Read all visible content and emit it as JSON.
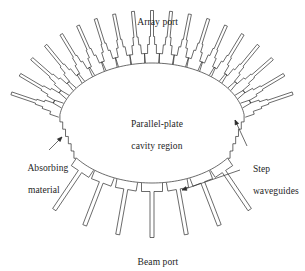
{
  "figure": {
    "type": "technical-line-diagram",
    "width": 305,
    "height": 265,
    "background_color": "#ffffff",
    "line_color": "#2b2b2b",
    "line_width": 0.7,
    "text_color": "#1d1d1d"
  },
  "labels": {
    "array_port": "Array port",
    "cavity_line1": "Parallel-plate",
    "cavity_line2": "cavity region",
    "absorbing_line1": "Absorbing",
    "absorbing_line2": "material",
    "step_line1": "Step",
    "step_line2": "waveguides",
    "beam_port": "Beam port"
  },
  "label_positions": {
    "array_port": {
      "x": 111,
      "y": 6,
      "w": 84
    },
    "cavity": {
      "x": 100,
      "y": 108,
      "w": 104
    },
    "absorbing": {
      "x": 18,
      "y": 152,
      "w": 66
    },
    "step": {
      "x": 243,
      "y": 153,
      "w": 62
    },
    "beam_port": {
      "x": 113,
      "y": 246,
      "w": 80
    }
  },
  "geometry": {
    "cavity_center": {
      "cx": 152,
      "cy": 123
    },
    "cavity_radius": {
      "rx": 93,
      "ry": 60
    },
    "array_arc_deg": {
      "start": 188,
      "end": 352
    },
    "beam_arc_deg": {
      "start": 36,
      "end": 144
    },
    "array_waveguide_count": 19,
    "beam_waveguide_count": 7,
    "staircase_steps": 6
  },
  "waveguide_profile": {
    "base_half_width": 7.4,
    "base_length": 9.5,
    "mid_half_width": 4.4,
    "mid_length": 9.0,
    "step_half_width": 2.6,
    "step_length": 8.0,
    "stem_half_width": 1.5,
    "stem_length": 26
  },
  "beam_waveguide_profile": {
    "base_half_width": 10.5,
    "base_length": 8.5,
    "stem_half_width": 2.0,
    "stem_length": 46
  },
  "leaders": {
    "absorbing": {
      "x1": 49,
      "y1": 150,
      "x2": 62,
      "y2": 137
    },
    "step_upper": {
      "x1": 247,
      "y1": 146,
      "x2": 235,
      "y2": 120
    },
    "step_lower": {
      "x1": 240,
      "y1": 170,
      "x2": 182,
      "y2": 190
    }
  }
}
